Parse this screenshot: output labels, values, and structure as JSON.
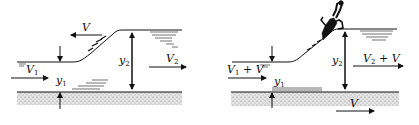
{
  "diagram": {
    "type": "hydraulic-jump-illustration",
    "panels": [
      {
        "id": "left",
        "description": "Moving hydraulic jump (bore) moving upstream with speed V",
        "labels": {
          "jump_velocity": "V",
          "upstream_velocity": "V",
          "upstream_velocity_sub": "1",
          "upstream_depth": "y",
          "upstream_depth_sub": "1",
          "downstream_depth": "y",
          "downstream_depth_sub": "2",
          "downstream_velocity": "V",
          "downstream_velocity_sub": "2"
        }
      },
      {
        "id": "right",
        "description": "Same jump viewed in frame moving with the jump (observer riding the jump, bed moves at V)",
        "labels": {
          "upstream_velocity": "V",
          "upstream_velocity_sub": "1",
          "upstream_velocity_suffix": " + V",
          "upstream_depth": "y",
          "upstream_depth_sub": "1",
          "downstream_depth": "y",
          "downstream_depth_sub": "2",
          "downstream_velocity": "V",
          "downstream_velocity_sub": "2",
          "downstream_velocity_suffix": " + V",
          "bed_velocity": "V"
        }
      }
    ],
    "colors": {
      "ink": "#111111",
      "bed_fill": "#cfcfcf"
    }
  }
}
